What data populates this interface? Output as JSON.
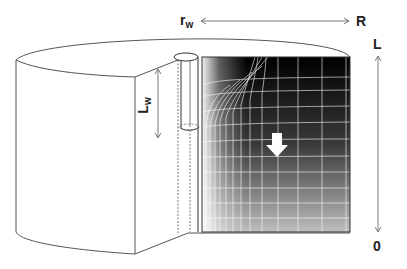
{
  "diagram": {
    "labels": {
      "rw": {
        "main": "r",
        "sub": "w"
      },
      "R": "R",
      "L": "L",
      "zero": "0",
      "Lw": {
        "main": "L",
        "sub": "w"
      }
    },
    "colors": {
      "outline": "#555555",
      "grid_line": "#ffffff",
      "gradient_top": "#000000",
      "gradient_bottom": "#bdbdbd",
      "arrow_fill": "#ffffff"
    },
    "annotations": {
      "flow_arrow": "down",
      "rw_to_R_arrow": "double-headed horizontal",
      "L_to_0_arrow": "double-headed vertical",
      "Lw_arrow": "double-headed vertical"
    }
  }
}
